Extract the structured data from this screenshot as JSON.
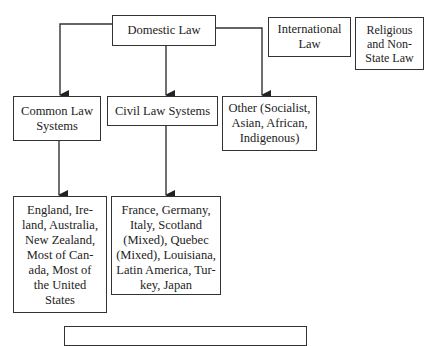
{
  "diagram": {
    "nodes": {
      "domestic": {
        "label": "Domestic Law"
      },
      "international": {
        "label": "International\nLaw"
      },
      "religious": {
        "label": "Religious\nand Non-\nState Law"
      },
      "common": {
        "label": "Common Law\nSystems"
      },
      "civil": {
        "label": "Civil Law Systems"
      },
      "other": {
        "label": "Other (Socialist,\nAsian, African,\nIndigenous)"
      },
      "common_examples": {
        "label": "England, Ire-\nland, Australia,\nNew Zealand,\nMost of Can-\nada, Most of\nthe United\nStates"
      },
      "civil_examples": {
        "label": "France, Germany,\nItaly, Scotland\n(Mixed), Quebec\n(Mixed), Louisiana,\nLatin America, Tur-\nkey, Japan"
      },
      "bottom": {
        "label": ""
      }
    },
    "edges": [
      {
        "from": "domestic",
        "to": "common"
      },
      {
        "from": "domestic",
        "to": "civil"
      },
      {
        "from": "domestic",
        "to": "other"
      },
      {
        "from": "common",
        "to": "common_examples"
      },
      {
        "from": "civil",
        "to": "civil_examples"
      }
    ]
  }
}
